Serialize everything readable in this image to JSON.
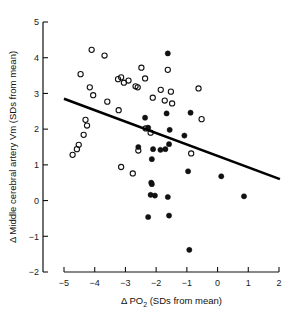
{
  "chart_data": {
    "type": "scatter",
    "title": "",
    "xlabel": "Δ PO2 (SDs from mean)",
    "xlabel_main": "Δ PO",
    "xlabel_sub": "2",
    "xlabel_tail": " (SDs from mean)",
    "ylabel": "Δ Middle cerebral artery Vm (SDs from mean)",
    "xlim": [
      -5,
      2
    ],
    "ylim": [
      -2,
      5
    ],
    "xticks": [
      -5,
      -4,
      -3,
      -2,
      -1,
      0,
      1,
      2
    ],
    "xtick_labels": [
      "−5",
      "−4",
      "−3",
      "−2",
      "−1",
      "0",
      "1",
      "2"
    ],
    "yticks": [
      -2,
      -1,
      0,
      1,
      2,
      3,
      4,
      5
    ],
    "ytick_labels": [
      "−2",
      "−1",
      "0",
      "1",
      "2",
      "3",
      "4",
      "5"
    ],
    "grid": false,
    "legend": null,
    "marker_colors": {
      "open": "#111111",
      "filled": "#111111",
      "fit_line": "#000000"
    },
    "series": [
      {
        "name": "open-circles",
        "marker": "open-circle",
        "points": [
          [
            -4.46,
            3.54
          ],
          [
            -4.1,
            4.22
          ],
          [
            -3.68,
            4.06
          ],
          [
            -4.16,
            3.17
          ],
          [
            -4.05,
            2.95
          ],
          [
            -3.59,
            2.77
          ],
          [
            -3.24,
            3.4
          ],
          [
            -3.14,
            3.45
          ],
          [
            -3.05,
            3.3
          ],
          [
            -2.9,
            3.36
          ],
          [
            -2.67,
            3.2
          ],
          [
            -2.6,
            3.17
          ],
          [
            -2.48,
            3.72
          ],
          [
            -2.36,
            3.42
          ],
          [
            -3.22,
            2.53
          ],
          [
            -1.85,
            3.1
          ],
          [
            -1.72,
            2.8
          ],
          [
            -1.62,
            3.66
          ],
          [
            -1.52,
            3.05
          ],
          [
            -1.48,
            2.72
          ],
          [
            -0.62,
            3.14
          ],
          [
            -0.52,
            2.28
          ],
          [
            -4.3,
            2.26
          ],
          [
            -4.25,
            2.1
          ],
          [
            -4.36,
            1.84
          ],
          [
            -4.52,
            1.56
          ],
          [
            -4.58,
            1.44
          ],
          [
            -4.72,
            1.28
          ],
          [
            -3.14,
            0.94
          ],
          [
            -2.76,
            0.76
          ],
          [
            -2.58,
            1.4
          ],
          [
            -2.34,
            2.02
          ],
          [
            -2.18,
            1.9
          ],
          [
            -2.11,
            2.88
          ],
          [
            -0.86,
            1.32
          ]
        ]
      },
      {
        "name": "filled-circles",
        "marker": "filled-circle",
        "points": [
          [
            -1.62,
            4.12
          ],
          [
            -1.66,
            2.44
          ],
          [
            -0.88,
            2.46
          ],
          [
            -2.36,
            2.32
          ],
          [
            -2.26,
            2.04
          ],
          [
            -1.56,
            1.98
          ],
          [
            -1.08,
            1.82
          ],
          [
            -1.58,
            1.58
          ],
          [
            -2.58,
            1.5
          ],
          [
            -2.1,
            1.44
          ],
          [
            -1.86,
            1.42
          ],
          [
            -1.7,
            1.44
          ],
          [
            -2.14,
            1.16
          ],
          [
            -0.96,
            0.82
          ],
          [
            0.12,
            0.68
          ],
          [
            -2.16,
            0.5
          ],
          [
            -2.14,
            0.46
          ],
          [
            -2.18,
            0.16
          ],
          [
            -2.04,
            0.14
          ],
          [
            -1.62,
            0.1
          ],
          [
            0.86,
            0.12
          ],
          [
            -2.26,
            -0.46
          ],
          [
            -1.58,
            -0.42
          ],
          [
            -0.92,
            -1.38
          ]
        ]
      }
    ],
    "fit_line": {
      "x": [
        -5.0,
        2.03
      ],
      "y": [
        2.85,
        0.6
      ],
      "style": "solid"
    }
  },
  "axis": {
    "y_title": "Δ Middle cerebral artery Vm (SDs from mean)"
  }
}
